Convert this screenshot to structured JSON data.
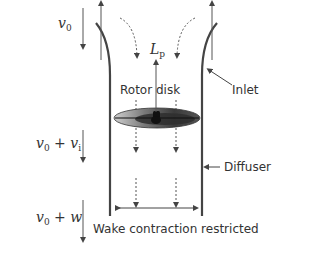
{
  "diagram": {
    "type": "ducted rotor momentum theory schematic",
    "labels": {
      "v0_symbol": "v",
      "v0_sub": "0",
      "v0_vi_a": "v",
      "v0_vi_a_sub": "0",
      "v0_vi_plus": " + ",
      "v0_vi_b": "v",
      "v0_vi_b_sub": "i",
      "v0_w_a": "v",
      "v0_w_a_sub": "0",
      "v0_w_plus": " + ",
      "v0_w_b": "w",
      "lift_symbol": "L",
      "lift_sub": "p",
      "rotor_disk": "Rotor disk",
      "inlet": "Inlet",
      "diffuser": "Diffuser",
      "wake": "Wake contraction restricted"
    },
    "colors": {
      "stroke": "#444444",
      "text": "#333333",
      "disk_dark": "#2a2a2a",
      "disk_light": "#bbbbbb"
    }
  }
}
